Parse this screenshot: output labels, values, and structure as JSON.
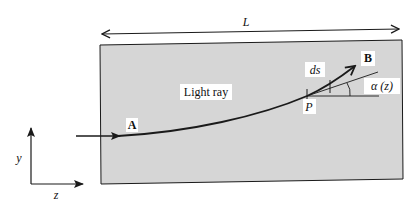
{
  "diagram": {
    "box_fill": "#d6d6d6",
    "stroke": "#1a1a1a",
    "length_label": "L",
    "point_a": "A",
    "point_b": "B",
    "point_p": "P",
    "ray_label": "Light ray",
    "segment_label": "ds",
    "angle_label": "α (z)",
    "axis_y": "y",
    "axis_z": "z"
  }
}
